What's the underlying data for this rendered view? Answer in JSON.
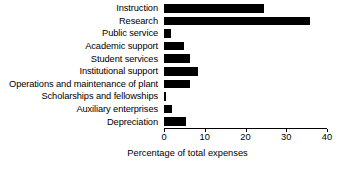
{
  "chart_data": {
    "type": "bar",
    "orientation": "horizontal",
    "title": "",
    "subtitle": "",
    "xlabel": "Percentage of total expenses",
    "ylabel": "",
    "categories": [
      "Instruction",
      "Research",
      "Public service",
      "Academic support",
      "Student services",
      "Institutional support",
      "Operations and maintenance of plant",
      "Scholarships and fellowships",
      "Auxiliary enterprises",
      "Depreciation"
    ],
    "values": [
      24.6,
      35.9,
      1.7,
      5.0,
      6.4,
      8.4,
      6.4,
      0.5,
      2.0,
      5.4
    ],
    "xlim": [
      0,
      40
    ],
    "xticks": [
      0,
      10,
      20,
      30,
      40
    ],
    "xtick_labels": [
      "0",
      "10",
      "20",
      "30",
      "40"
    ],
    "grid": false,
    "legend": false,
    "bar_color": "#000000",
    "axis_color": "#000000",
    "background_color": "#ffffff"
  }
}
